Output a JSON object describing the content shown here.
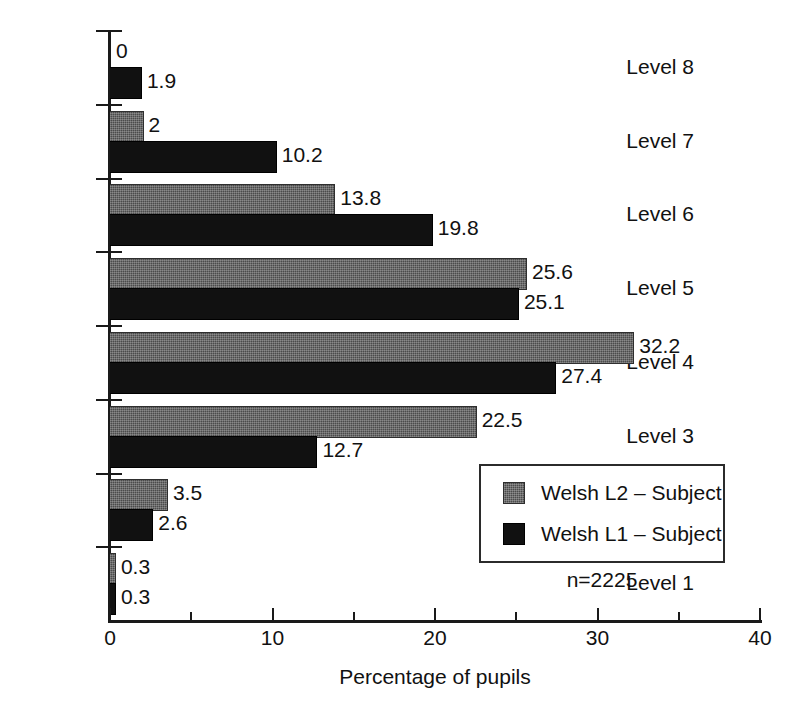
{
  "chart_data": {
    "type": "bar",
    "orientation": "horizontal",
    "title": "",
    "xlabel": "Percentage of pupils",
    "ylabel": "",
    "xlim": [
      0,
      40
    ],
    "xticks": [
      0,
      10,
      20,
      30,
      40
    ],
    "xtick_labels": [
      "0",
      "10",
      "20",
      "30",
      "40"
    ],
    "minor_xticks": [
      5,
      15,
      25,
      35
    ],
    "grid": false,
    "legend_position": "inside-lower-right",
    "categories": [
      "Level 8",
      "Level 7",
      "Level 6",
      "Level 5",
      "Level 4",
      "Level 3",
      "Level 2",
      "Level 1"
    ],
    "series": [
      {
        "name": "Welsh L2 – Subject",
        "color": "#4b4b4b",
        "values": [
          0,
          2,
          13.8,
          25.6,
          32.2,
          22.5,
          3.5,
          0.3
        ],
        "labels": [
          "0",
          "2",
          "13.8",
          "25.6",
          "32.2",
          "22.5",
          "3.5",
          "0.3"
        ]
      },
      {
        "name": "Welsh L1 – Subject",
        "color": "#111111",
        "values": [
          1.9,
          10.2,
          19.8,
          25.1,
          27.4,
          12.7,
          2.6,
          0.3
        ],
        "labels": [
          "1.9",
          "10.2",
          "19.8",
          "25.1",
          "27.4",
          "12.7",
          "2.6",
          "0.3"
        ]
      }
    ],
    "annotations": [
      {
        "text": "n=2225"
      }
    ]
  },
  "legend": {
    "entries": [
      {
        "label": "Welsh L2 – Subject",
        "swatch": "grey-hatched-swatch"
      },
      {
        "label": "Welsh L1 – Subject",
        "swatch": "black-swatch"
      }
    ]
  },
  "notes": {
    "sample_size": "n=2225"
  },
  "axis": {
    "x_title": "Percentage of pupils"
  }
}
